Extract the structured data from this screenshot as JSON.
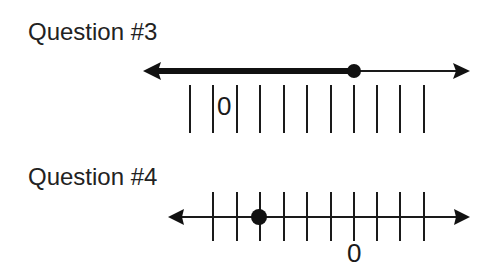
{
  "questions": [
    {
      "title": "Question #3",
      "zero_label": "0",
      "number_line": {
        "line_y": 71,
        "x_start": 143,
        "x_end": 470,
        "tick_style": "below",
        "tick_y1": 85,
        "tick_y2": 133,
        "ticks_x": [
          190,
          213,
          237,
          260,
          284,
          307,
          331,
          354,
          377,
          400,
          424
        ],
        "zero_label_between_ticks": [
          1,
          2
        ],
        "point": {
          "x": 354,
          "filled": true
        },
        "shaded": {
          "from_x": 143,
          "to_x": 354,
          "direction": "left"
        }
      }
    },
    {
      "title": "Question #4",
      "zero_label": "0",
      "number_line": {
        "line_y": 217,
        "x_start": 168,
        "x_end": 470,
        "tick_style": "crossing",
        "tick_y1": 192,
        "tick_y2": 241,
        "ticks_x": [
          213,
          237,
          260,
          284,
          307,
          331,
          354,
          377,
          400,
          424
        ],
        "zero_tick_index": 6,
        "point": {
          "x": 259,
          "filled": true,
          "value": -4
        }
      }
    }
  ]
}
